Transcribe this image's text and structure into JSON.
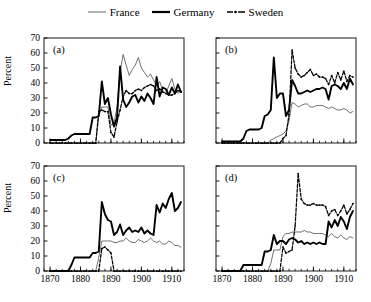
{
  "legend": {
    "position": "top-center",
    "entries": [
      {
        "label": "France",
        "style": "thin-solid",
        "icon": "line-swatch-icon"
      },
      {
        "label": "Germany",
        "style": "thick-solid",
        "icon": "line-swatch-icon"
      },
      {
        "label": "Sweden",
        "style": "dashed-markers",
        "icon": "dashed-line-swatch-icon"
      }
    ]
  },
  "axes": {
    "ylabel": "Percent",
    "yticks": [
      0,
      10,
      20,
      30,
      40,
      50,
      60,
      70
    ],
    "ylim": [
      0,
      70
    ],
    "xticks": [
      1870,
      1880,
      1890,
      1900,
      1910
    ],
    "xlim": [
      1868,
      1914
    ],
    "xminor_step": 2
  },
  "panel_labels": {
    "a": "(a)",
    "b": "(b)",
    "c": "(c)",
    "d": "(d)"
  },
  "colors": {
    "france": "#555555",
    "germany": "#000000",
    "sweden": "#000000",
    "axis": "#000000",
    "background": "#ffffff"
  },
  "chart_data": [
    {
      "id": "a",
      "type": "line",
      "title": "(a)",
      "xlabel": "",
      "ylabel": "Percent",
      "xlim": [
        1868,
        1914
      ],
      "ylim": [
        0,
        70
      ],
      "grid": false,
      "legend": "shared-top",
      "x": [
        1870,
        1871,
        1872,
        1873,
        1874,
        1875,
        1876,
        1877,
        1878,
        1879,
        1880,
        1881,
        1882,
        1883,
        1884,
        1885,
        1886,
        1887,
        1888,
        1889,
        1890,
        1891,
        1892,
        1893,
        1894,
        1895,
        1896,
        1897,
        1898,
        1899,
        1900,
        1901,
        1902,
        1903,
        1904,
        1905,
        1906,
        1907,
        1908,
        1909,
        1910,
        1911,
        1912,
        1913
      ],
      "series": [
        {
          "name": "France",
          "values": [
            0,
            0,
            0,
            0,
            0,
            0,
            0,
            0,
            0,
            0,
            0,
            0,
            0,
            0,
            0,
            0,
            18,
            24,
            24,
            24,
            12,
            13,
            24,
            47,
            59,
            52,
            45,
            49,
            52,
            57,
            50,
            47,
            44,
            46,
            42,
            38,
            41,
            35,
            33,
            38,
            43,
            36,
            33,
            35
          ]
        },
        {
          "name": "Germany",
          "values": [
            2,
            2,
            2,
            2,
            2,
            2,
            3,
            5,
            6,
            6,
            6,
            6,
            6,
            6,
            17,
            17,
            18,
            41,
            26,
            30,
            19,
            11,
            17,
            51,
            29,
            24,
            27,
            31,
            32,
            27,
            31,
            28,
            33,
            30,
            26,
            44,
            31,
            37,
            36,
            32,
            37,
            33,
            39,
            34
          ]
        },
        {
          "name": "Sweden",
          "values": [
            0,
            0,
            0,
            0,
            0,
            0,
            0,
            0,
            0,
            0,
            0,
            0,
            0,
            0,
            0,
            0,
            21,
            22,
            21,
            21,
            7,
            4,
            14,
            22,
            31,
            35,
            33,
            33,
            35,
            36,
            35,
            37,
            38,
            39,
            38,
            35,
            36,
            34,
            33,
            32,
            32,
            33,
            35,
            34
          ]
        }
      ]
    },
    {
      "id": "b",
      "type": "line",
      "title": "(b)",
      "xlabel": "",
      "ylabel": "",
      "xlim": [
        1868,
        1914
      ],
      "ylim": [
        0,
        70
      ],
      "grid": false,
      "legend": "shared-top",
      "x": [
        1870,
        1871,
        1872,
        1873,
        1874,
        1875,
        1876,
        1877,
        1878,
        1879,
        1880,
        1881,
        1882,
        1883,
        1884,
        1885,
        1886,
        1887,
        1888,
        1889,
        1890,
        1891,
        1892,
        1893,
        1894,
        1895,
        1896,
        1897,
        1898,
        1899,
        1900,
        1901,
        1902,
        1903,
        1904,
        1905,
        1906,
        1907,
        1908,
        1909,
        1910,
        1911,
        1912,
        1913
      ],
      "series": [
        {
          "name": "France",
          "values": [
            0,
            0,
            0,
            0,
            0,
            0,
            0,
            0,
            0,
            0,
            0,
            0,
            0,
            0,
            0,
            0,
            2,
            3,
            4,
            5,
            6,
            8,
            15,
            27,
            26,
            24,
            25,
            26,
            26,
            24,
            24,
            25,
            25,
            25,
            24,
            23,
            24,
            23,
            22,
            22,
            23,
            22,
            20,
            21
          ]
        },
        {
          "name": "Germany",
          "values": [
            1,
            1,
            1,
            1,
            1,
            1,
            1,
            3,
            8,
            9,
            9,
            9,
            9,
            10,
            18,
            19,
            22,
            57,
            30,
            33,
            33,
            18,
            22,
            42,
            38,
            33,
            33,
            34,
            35,
            34,
            35,
            36,
            36,
            37,
            36,
            29,
            38,
            39,
            38,
            36,
            40,
            36,
            43,
            39
          ]
        },
        {
          "name": "Sweden",
          "values": [
            0,
            0,
            0,
            0,
            0,
            0,
            0,
            0,
            0,
            0,
            0,
            0,
            0,
            0,
            0,
            0,
            0,
            0,
            0,
            0,
            3,
            5,
            19,
            62,
            50,
            46,
            44,
            45,
            47,
            49,
            45,
            46,
            44,
            44,
            43,
            39,
            45,
            40,
            47,
            42,
            48,
            41,
            45,
            44
          ]
        }
      ]
    },
    {
      "id": "c",
      "type": "line",
      "title": "(c)",
      "xlabel": "",
      "ylabel": "Percent",
      "xlim": [
        1868,
        1914
      ],
      "ylim": [
        0,
        70
      ],
      "grid": false,
      "legend": "shared-top",
      "x": [
        1870,
        1871,
        1872,
        1873,
        1874,
        1875,
        1876,
        1877,
        1878,
        1879,
        1880,
        1881,
        1882,
        1883,
        1884,
        1885,
        1886,
        1887,
        1888,
        1889,
        1890,
        1891,
        1892,
        1893,
        1894,
        1895,
        1896,
        1897,
        1898,
        1899,
        1900,
        1901,
        1902,
        1903,
        1904,
        1905,
        1906,
        1907,
        1908,
        1909,
        1910,
        1911,
        1912,
        1913
      ],
      "series": [
        {
          "name": "France",
          "values": [
            0,
            0,
            0,
            0,
            0,
            0,
            0,
            0,
            0,
            0,
            0,
            0,
            0,
            0,
            0,
            0,
            9,
            20,
            20,
            20,
            20,
            19,
            19,
            20,
            20,
            22,
            20,
            19,
            19,
            21,
            20,
            19,
            20,
            22,
            20,
            19,
            20,
            18,
            18,
            20,
            19,
            17,
            17,
            16
          ]
        },
        {
          "name": "Germany",
          "values": [
            0,
            0,
            0,
            0,
            0,
            0,
            0,
            4,
            9,
            9,
            9,
            9,
            9,
            9,
            12,
            12,
            13,
            46,
            38,
            34,
            33,
            24,
            26,
            31,
            24,
            27,
            29,
            26,
            27,
            26,
            29,
            25,
            27,
            25,
            24,
            44,
            39,
            45,
            42,
            48,
            52,
            40,
            42,
            46
          ]
        },
        {
          "name": "Sweden",
          "values": [
            0,
            0,
            0,
            0,
            0,
            0,
            0,
            0,
            0,
            0,
            0,
            0,
            0,
            0,
            0,
            0,
            0,
            15,
            16,
            14,
            12,
            0,
            0,
            0,
            0,
            0,
            0,
            0,
            0,
            0,
            0,
            0,
            0,
            0,
            0,
            0,
            0,
            0,
            0,
            0,
            0,
            0,
            0,
            0
          ]
        }
      ]
    },
    {
      "id": "d",
      "type": "line",
      "title": "(d)",
      "xlabel": "",
      "ylabel": "",
      "xlim": [
        1868,
        1914
      ],
      "ylim": [
        0,
        70
      ],
      "grid": false,
      "legend": "shared-top",
      "x": [
        1870,
        1871,
        1872,
        1873,
        1874,
        1875,
        1876,
        1877,
        1878,
        1879,
        1880,
        1881,
        1882,
        1883,
        1884,
        1885,
        1886,
        1887,
        1888,
        1889,
        1890,
        1891,
        1892,
        1893,
        1894,
        1895,
        1896,
        1897,
        1898,
        1899,
        1900,
        1901,
        1902,
        1903,
        1904,
        1905,
        1906,
        1907,
        1908,
        1909,
        1910,
        1911,
        1912,
        1913
      ],
      "series": [
        {
          "name": "France",
          "values": [
            0,
            0,
            0,
            0,
            0,
            0,
            0,
            0,
            0,
            0,
            0,
            0,
            0,
            0,
            0,
            0,
            5,
            14,
            14,
            14,
            23,
            25,
            25,
            26,
            26,
            26,
            26,
            27,
            26,
            26,
            25,
            25,
            25,
            25,
            24,
            23,
            25,
            23,
            22,
            24,
            22,
            21,
            23,
            22
          ]
        },
        {
          "name": "Germany",
          "values": [
            0,
            0,
            0,
            0,
            0,
            0,
            0,
            4,
            4,
            4,
            4,
            4,
            4,
            4,
            13,
            13,
            14,
            24,
            18,
            20,
            20,
            18,
            21,
            22,
            21,
            19,
            20,
            18,
            19,
            18,
            19,
            18,
            19,
            18,
            18,
            33,
            29,
            34,
            30,
            36,
            33,
            28,
            36,
            40
          ]
        },
        {
          "name": "Sweden",
          "values": [
            0,
            0,
            0,
            0,
            0,
            0,
            0,
            0,
            0,
            0,
            0,
            0,
            0,
            0,
            0,
            0,
            0,
            0,
            0,
            0,
            16,
            12,
            13,
            14,
            30,
            65,
            48,
            45,
            44,
            44,
            45,
            44,
            44,
            44,
            43,
            37,
            40,
            41,
            37,
            40,
            44,
            38,
            41,
            45
          ]
        }
      ]
    }
  ]
}
